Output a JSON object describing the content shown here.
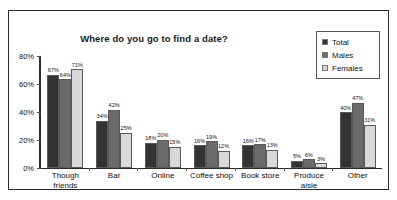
{
  "chart_data": {
    "type": "bar",
    "title": "Where do you go to find a date?",
    "xlabel": "",
    "ylabel": "",
    "ylim": [
      0,
      80
    ],
    "yticks": [
      "0%",
      "20%",
      "40%",
      "60%",
      "80%"
    ],
    "grid": false,
    "legend_position": "top-right",
    "categories": [
      "Though friends",
      "Bar",
      "Online",
      "Coffee shop",
      "Book store",
      "Produce aisle",
      "Other"
    ],
    "category_lines": [
      [
        "Though",
        "friends"
      ],
      [
        "Bar"
      ],
      [
        "Online"
      ],
      [
        "Coffee shop"
      ],
      [
        "Book store"
      ],
      [
        "Produce",
        "aisle"
      ],
      [
        "Other"
      ]
    ],
    "series": [
      {
        "name": "Total",
        "color": "#333333",
        "values": [
          67,
          34,
          18,
          16,
          16,
          5,
          40
        ],
        "labels": [
          "67%",
          "34%",
          "18%",
          "16%",
          "16%",
          "5%",
          "40%"
        ]
      },
      {
        "name": "Males",
        "color": "#6b6b6b",
        "values": [
          64,
          42,
          20,
          19,
          17,
          6,
          47
        ],
        "labels": [
          "64%",
          "42%",
          "20%",
          "19%",
          "17%",
          "6%",
          "47%"
        ]
      },
      {
        "name": "Females",
        "color": "#d8d8d8",
        "values": [
          71,
          25,
          15,
          12,
          13,
          3,
          31
        ],
        "labels": [
          "71%",
          "25%",
          "15%",
          "12%",
          "13%",
          "3%",
          "31%"
        ]
      }
    ]
  },
  "legend": {
    "items": [
      {
        "label": "Total",
        "color": "#333333"
      },
      {
        "label": "Males",
        "color": "#6b6b6b"
      },
      {
        "label": "Females",
        "color": "#d8d8d8"
      }
    ]
  }
}
